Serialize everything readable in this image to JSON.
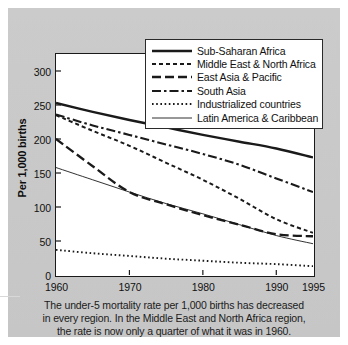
{
  "chart_data": {
    "type": "line",
    "title": "",
    "xlabel": "",
    "ylabel": "Per 1,000 births",
    "xlim": [
      1960,
      1995
    ],
    "ylim": [
      0,
      325
    ],
    "yticks": [
      0,
      50,
      100,
      150,
      200,
      250,
      300
    ],
    "xticks": [
      1960,
      1970,
      1980,
      1990,
      1995
    ],
    "grid": false,
    "legend_position": "upper-right",
    "x": [
      1960,
      1965,
      1970,
      1975,
      1980,
      1985,
      1990,
      1995
    ],
    "series": [
      {
        "name": "Sub-Saharan Africa",
        "style": "solid-thick",
        "values": [
          253,
          240,
          228,
          217,
          206,
          196,
          186,
          173
        ]
      },
      {
        "name": "Middle East & North Africa",
        "style": "dashed",
        "values": [
          235,
          212,
          190,
          165,
          140,
          112,
          82,
          62
        ]
      },
      {
        "name": "East Asia & Pacific",
        "style": "long-dash",
        "values": [
          200,
          160,
          122,
          104,
          88,
          74,
          60,
          57
        ]
      },
      {
        "name": "South Asia",
        "style": "dash-dot",
        "values": [
          236,
          220,
          206,
          192,
          178,
          162,
          142,
          122
        ]
      },
      {
        "name": "Industrialized countries",
        "style": "dotted",
        "values": [
          37,
          32,
          28,
          24,
          21,
          18,
          16,
          13
        ]
      },
      {
        "name": "Latin America & Caribbean",
        "style": "solid-thin",
        "values": [
          158,
          140,
          122,
          105,
          90,
          74,
          58,
          46
        ]
      }
    ]
  },
  "axis": {
    "y_tick_labels": [
      "300",
      "250",
      "200",
      "150",
      "100",
      "50",
      "0"
    ],
    "y_tick_values": [
      300,
      250,
      200,
      150,
      100,
      50,
      0
    ],
    "x_tick_labels": [
      "1960",
      "1970",
      "1980",
      "1990",
      "1995"
    ],
    "x_tick_values": [
      1960,
      1970,
      1980,
      1990,
      1995
    ],
    "y_title": "Per 1,000 births"
  },
  "legend": {
    "items": [
      {
        "label": "Sub-Saharan Africa",
        "style": "solid-thick"
      },
      {
        "label": "Middle East & North Africa",
        "style": "dashed"
      },
      {
        "label": "East Asia & Pacific",
        "style": "long-dash"
      },
      {
        "label": "South Asia",
        "style": "dash-dot"
      },
      {
        "label": "Industrialized countries",
        "style": "dotted"
      },
      {
        "label": "Latin America & Caribbean",
        "style": "solid-thin"
      }
    ]
  },
  "caption": {
    "line1": "The under-5 mortality rate per 1,000 births has decreased",
    "line2": "in every region.  In the Middle East and North Africa region,",
    "line3": "the rate is now only a quarter of what it was in 1960."
  },
  "colors": {
    "panel": "#c9c9c9",
    "plot_background": "#ffffff",
    "line": "#1a1a1a",
    "text": "#111111"
  }
}
